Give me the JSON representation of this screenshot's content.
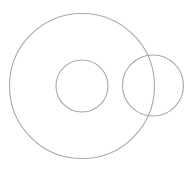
{
  "canvas": {
    "width": 196,
    "height": 169,
    "background": "#ffffff"
  },
  "stroke": {
    "color": "#a8a8a8",
    "width": 1.1
  },
  "shapes": [
    {
      "name": "large-outer-circle",
      "type": "circle",
      "cx": 82,
      "cy": 86,
      "r": 72.5
    },
    {
      "name": "inner-circle",
      "type": "circle",
      "cx": 82,
      "cy": 86,
      "r": 26
    },
    {
      "name": "right-overlapping-circle",
      "type": "circle",
      "cx": 153,
      "cy": 85.5,
      "r": 30.5
    }
  ]
}
